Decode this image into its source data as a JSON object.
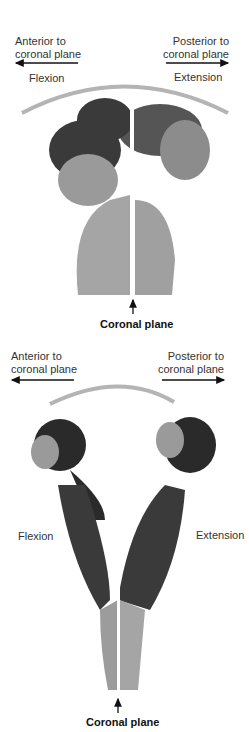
{
  "panels": [
    {
      "name": "neck",
      "anterior_label": "Anterior to\ncoronal plane",
      "posterior_label": "Posterior to\ncoronal plane",
      "flexion_label": "Flexion",
      "extension_label": "Extension",
      "plane_label": "Coronal plane"
    },
    {
      "name": "trunk",
      "anterior_label": "Anterior to\ncoronal plane",
      "posterior_label": "Posterior to\ncoronal plane",
      "flexion_label": "Flexion",
      "extension_label": "Extension",
      "plane_label": "Coronal plane"
    }
  ],
  "colors": {
    "arc": "#b4b4b4",
    "skin": "#9a9a9a",
    "hair": "#2a2a2a",
    "suit": "#3a3a3a"
  }
}
